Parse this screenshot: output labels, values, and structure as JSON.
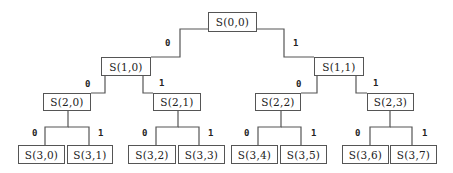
{
  "diagram": {
    "type": "binary-tree",
    "line_color": "#555555",
    "nodes": [
      {
        "id": "s00",
        "label": "S(0,0)",
        "level": 0,
        "x": 208,
        "y": 12,
        "w": 49,
        "h": 20
      },
      {
        "id": "s10",
        "label": "S(1,0)",
        "level": 1,
        "x": 101,
        "y": 57,
        "w": 50,
        "h": 19
      },
      {
        "id": "s11",
        "label": "S(1,1)",
        "level": 1,
        "x": 314,
        "y": 57,
        "w": 50,
        "h": 19
      },
      {
        "id": "s20",
        "label": "S(2,0)",
        "level": 2,
        "x": 43,
        "y": 93,
        "w": 48,
        "h": 18
      },
      {
        "id": "s21",
        "label": "S(2,1)",
        "level": 2,
        "x": 153,
        "y": 93,
        "w": 48,
        "h": 18
      },
      {
        "id": "s22",
        "label": "S(2,2)",
        "level": 2,
        "x": 255,
        "y": 93,
        "w": 46,
        "h": 18
      },
      {
        "id": "s23",
        "label": "S(2,3)",
        "level": 2,
        "x": 367,
        "y": 93,
        "w": 47,
        "h": 18
      },
      {
        "id": "s30",
        "label": "S(3,0)",
        "level": 3,
        "x": 18,
        "y": 145,
        "w": 47,
        "h": 19
      },
      {
        "id": "s31",
        "label": "S(3,1)",
        "level": 3,
        "x": 67,
        "y": 145,
        "w": 46,
        "h": 19
      },
      {
        "id": "s32",
        "label": "S(3,2)",
        "level": 3,
        "x": 128,
        "y": 145,
        "w": 48,
        "h": 19
      },
      {
        "id": "s33",
        "label": "S(3,3)",
        "level": 3,
        "x": 178,
        "y": 145,
        "w": 47,
        "h": 19
      },
      {
        "id": "s34",
        "label": "S(3,4)",
        "level": 3,
        "x": 231,
        "y": 145,
        "w": 47,
        "h": 19
      },
      {
        "id": "s35",
        "label": "S(3,5)",
        "level": 3,
        "x": 280,
        "y": 145,
        "w": 47,
        "h": 19
      },
      {
        "id": "s36",
        "label": "S(3,6)",
        "level": 3,
        "x": 342,
        "y": 145,
        "w": 47,
        "h": 19
      },
      {
        "id": "s37",
        "label": "S(3,7)",
        "level": 3,
        "x": 390,
        "y": 145,
        "w": 47,
        "h": 19
      }
    ],
    "edges": [
      {
        "from": "S(0,0)",
        "to": "S(1,0)",
        "bit": "0",
        "path": "208,29 180,29 180,57 151,57",
        "lx": 165,
        "ly": 38
      },
      {
        "from": "S(0,0)",
        "to": "S(1,1)",
        "bit": "1",
        "path": "257,29 284,29 284,57 314,57",
        "lx": 293,
        "ly": 38
      },
      {
        "from": "S(1,0)",
        "to": "S(2,0)",
        "bit": "0",
        "path": "105,76 105,93 91,93",
        "lx": 85,
        "ly": 79
      },
      {
        "from": "S(1,0)",
        "to": "S(2,1)",
        "bit": "1",
        "path": "143,76 143,93 153,93",
        "lx": 159,
        "ly": 78
      },
      {
        "from": "S(1,1)",
        "to": "S(2,2)",
        "bit": "0",
        "path": "317,76 317,93 301,93",
        "lx": 296,
        "ly": 79
      },
      {
        "from": "S(1,1)",
        "to": "S(2,3)",
        "bit": "1",
        "path": "356,76 356,93 367,93",
        "lx": 373,
        "ly": 78
      },
      {
        "from": "S(2,0)",
        "to": "S(3,0)",
        "bit": "0",
        "path": "68,111 68,127 45,127 45,145",
        "lx": 32,
        "ly": 128
      },
      {
        "from": "S(2,0)",
        "to": "S(3,1)",
        "bit": "1",
        "path": "68,127 89,127 89,145",
        "lx": 98,
        "ly": 128
      },
      {
        "from": "S(2,1)",
        "to": "S(3,2)",
        "bit": "0",
        "path": "178,111 178,127 156,127 156,145",
        "lx": 142,
        "ly": 128
      },
      {
        "from": "S(2,1)",
        "to": "S(3,3)",
        "bit": "1",
        "path": "178,127 199,127 199,145",
        "lx": 208,
        "ly": 128
      },
      {
        "from": "S(2,2)",
        "to": "S(3,4)",
        "bit": "0",
        "path": "281,111 281,127 258,127 258,145",
        "lx": 244,
        "ly": 128
      },
      {
        "from": "S(2,2)",
        "to": "S(3,5)",
        "bit": "1",
        "path": "281,127 301,127 301,145",
        "lx": 311,
        "ly": 128
      },
      {
        "from": "S(2,3)",
        "to": "S(3,6)",
        "bit": "0",
        "path": "390,111 390,127 370,127 370,145",
        "lx": 355,
        "ly": 128
      },
      {
        "from": "S(2,3)",
        "to": "S(3,7)",
        "bit": "1",
        "path": "390,127 412,127 412,145",
        "lx": 422,
        "ly": 128
      }
    ]
  }
}
